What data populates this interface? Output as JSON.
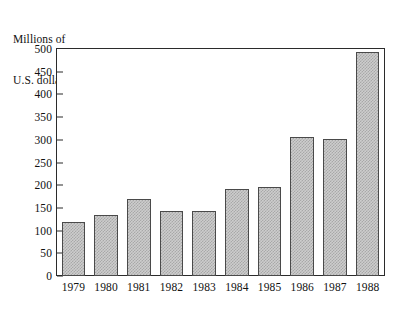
{
  "chart_data": {
    "type": "bar",
    "title": "",
    "subtitle": "",
    "axis_caption_lines": [
      "Millions of",
      "U.S. dollars"
    ],
    "xlabel": "",
    "ylabel": "Millions of U.S. dollars",
    "categories": [
      "1979",
      "1980",
      "1981",
      "1982",
      "1983",
      "1984",
      "1985",
      "1986",
      "1987",
      "1988"
    ],
    "values": [
      118,
      135,
      170,
      143,
      143,
      192,
      197,
      306,
      301,
      494
    ],
    "ylim": [
      0,
      500
    ],
    "ytick_values": [
      0,
      50,
      100,
      150,
      200,
      250,
      300,
      350,
      400,
      450,
      500
    ],
    "ytick_labels": [
      "0",
      "50",
      "100",
      "150",
      "200",
      "250",
      "300",
      "350",
      "400",
      "450",
      "500"
    ],
    "grid": false,
    "legend": null,
    "legend_position": "none",
    "bar_fill": "#cdcdcd",
    "bar_edge_color": "#4a4a4a",
    "frame_color": "#2b2b2b",
    "background": "#ffffff",
    "annotations": []
  }
}
